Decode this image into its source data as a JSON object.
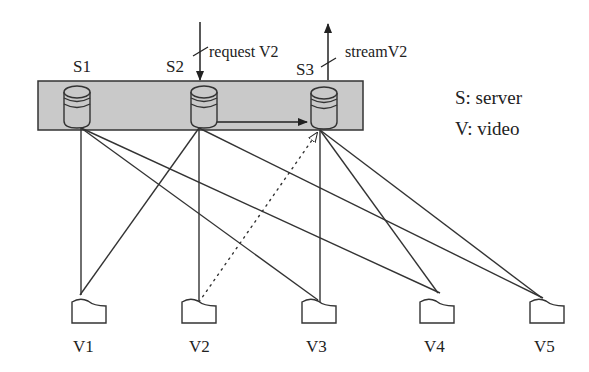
{
  "servers": [
    {
      "id": "S1",
      "label": "S1"
    },
    {
      "id": "S2",
      "label": "S2"
    },
    {
      "id": "S3",
      "label": "S3"
    }
  ],
  "videos": [
    {
      "id": "V1",
      "label": "V1"
    },
    {
      "id": "V2",
      "label": "V2"
    },
    {
      "id": "V3",
      "label": "V3"
    },
    {
      "id": "V4",
      "label": "V4"
    },
    {
      "id": "V5",
      "label": "V5"
    }
  ],
  "annotations": {
    "request": "request V2",
    "stream": "streamV2"
  },
  "legend": {
    "server": "S: server",
    "video": "V: video"
  },
  "colors": {
    "cluster_fill": "#c9c9c9",
    "line": "#333333"
  }
}
